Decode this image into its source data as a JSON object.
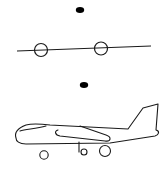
{
  "figure": {
    "background": "#ffffff",
    "stroke_color": "#1a1a1a",
    "fill_color": "#000000",
    "panels": [
      {
        "name": "abstract-plane",
        "elements": [
          "dot",
          "line",
          "circle",
          "circle"
        ]
      },
      {
        "name": "airplane-drawing",
        "elements": [
          "dot",
          "fuselage",
          "cockpit-window",
          "wing",
          "tail-fin",
          "landing-gear",
          "wheel",
          "wheel",
          "wheel"
        ]
      }
    ]
  }
}
